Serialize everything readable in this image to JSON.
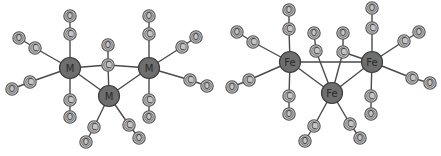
{
  "diagrams": [
    {
      "name": "left-cluster",
      "metals": [
        {
          "id": "M1",
          "label": "M",
          "x": 70,
          "y": 68
        },
        {
          "id": "M2",
          "label": "M",
          "x": 109,
          "y": 96
        },
        {
          "id": "M3",
          "label": "M",
          "x": 149,
          "y": 68
        }
      ],
      "metal_bonds": [
        {
          "from": "M1",
          "to": "M2"
        },
        {
          "from": "M2",
          "to": "M3"
        }
      ],
      "carbonyls": [
        {
          "metals": [
            "M1"
          ],
          "c": [
            70,
            34
          ],
          "o": [
            70,
            16
          ]
        },
        {
          "metals": [
            "M1"
          ],
          "c": [
            70,
            100
          ],
          "o": [
            70,
            117
          ]
        },
        {
          "metals": [
            "M1"
          ],
          "c": [
            35,
            48
          ],
          "o": [
            19,
            38
          ]
        },
        {
          "metals": [
            "M1"
          ],
          "c": [
            30,
            82
          ],
          "o": [
            12,
            89
          ]
        },
        {
          "metals": [
            "M3"
          ],
          "c": [
            149,
            34
          ],
          "o": [
            149,
            16
          ]
        },
        {
          "metals": [
            "M3"
          ],
          "c": [
            149,
            100
          ],
          "o": [
            149,
            117
          ]
        },
        {
          "metals": [
            "M3"
          ],
          "c": [
            182,
            47
          ],
          "o": [
            196,
            37
          ]
        },
        {
          "metals": [
            "M3"
          ],
          "c": [
            190,
            80
          ],
          "o": [
            207,
            86
          ]
        },
        {
          "metals": [
            "M1",
            "M2",
            "M3"
          ],
          "c": [
            108,
            65
          ],
          "o": [
            108,
            45
          ]
        },
        {
          "metals": [
            "M2"
          ],
          "c": [
            94,
            127
          ],
          "o": [
            86,
            142
          ]
        },
        {
          "metals": [
            "M2"
          ],
          "c": [
            129,
            125
          ],
          "o": [
            139,
            138
          ]
        }
      ]
    },
    {
      "name": "right-cluster-fe3co12",
      "metals": [
        {
          "id": "Fe1",
          "label": "Fe",
          "x": 290,
          "y": 62
        },
        {
          "id": "Fe2",
          "label": "Fe",
          "x": 332,
          "y": 93
        },
        {
          "id": "Fe3",
          "label": "Fe",
          "x": 372,
          "y": 62
        }
      ],
      "metal_bonds": [
        {
          "from": "Fe1",
          "to": "Fe2"
        },
        {
          "from": "Fe2",
          "to": "Fe3"
        },
        {
          "from": "Fe1",
          "to": "Fe3"
        }
      ],
      "carbonyls": [
        {
          "metals": [
            "Fe1"
          ],
          "c": [
            289,
            29
          ],
          "o": [
            289,
            10
          ]
        },
        {
          "metals": [
            "Fe1"
          ],
          "c": [
            289,
            96
          ],
          "o": [
            289,
            114
          ]
        },
        {
          "metals": [
            "Fe1"
          ],
          "c": [
            253,
            42
          ],
          "o": [
            237,
            32
          ]
        },
        {
          "metals": [
            "Fe1"
          ],
          "c": [
            249,
            80
          ],
          "o": [
            232,
            87
          ]
        },
        {
          "metals": [
            "Fe3"
          ],
          "c": [
            372,
            28
          ],
          "o": [
            372,
            8
          ]
        },
        {
          "metals": [
            "Fe3"
          ],
          "c": [
            371,
            96
          ],
          "o": [
            371,
            114
          ]
        },
        {
          "metals": [
            "Fe3"
          ],
          "c": [
            404,
            41
          ],
          "o": [
            419,
            32
          ]
        },
        {
          "metals": [
            "Fe3"
          ],
          "c": [
            412,
            78
          ],
          "o": [
            430,
            83
          ]
        },
        {
          "metals": [
            "Fe2"
          ],
          "c": [
            316,
            51
          ],
          "o": [
            314,
            33
          ]
        },
        {
          "metals": [
            "Fe2",
            "Fe3"
          ],
          "c": [
            343,
            52
          ],
          "o": [
            343,
            33
          ]
        },
        {
          "metals": [
            "Fe2"
          ],
          "c": [
            314,
            126
          ],
          "o": [
            305,
            141
          ]
        },
        {
          "metals": [
            "Fe2"
          ],
          "c": [
            350,
            124
          ],
          "o": [
            360,
            138
          ]
        }
      ]
    }
  ],
  "labels": {
    "carbon": "C",
    "oxygen": "O"
  },
  "colors": {
    "metal_fill": "#6e6e6e",
    "ligand_fill": "#c4c4c4",
    "bond": "#4a4a4a"
  }
}
